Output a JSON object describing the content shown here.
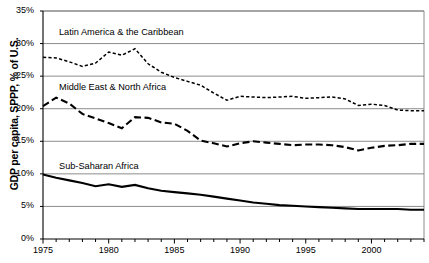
{
  "title_fragment": "",
  "axes": {
    "y_label": "GDP per capita, SPPP, % of U.S.",
    "y_ticks": [
      "35%",
      "30%",
      "25%",
      "20%",
      "15%",
      "10%",
      "5%",
      "0%"
    ],
    "x_ticks": [
      "1975",
      "1980",
      "1985",
      "1990",
      "1995",
      "2000"
    ]
  },
  "series_labels": {
    "lac": "Latin America & the Caribbean",
    "mena": "Middle East & North Africa",
    "ssa": "Sub-Saharan Africa"
  },
  "chart_data": {
    "type": "line",
    "title": "",
    "xlabel": "",
    "ylabel": "GDP per capita, SPPP, % of U.S.",
    "xlim": [
      1975,
      2004
    ],
    "ylim": [
      0,
      35
    ],
    "y_tick_values": [
      0,
      5,
      10,
      15,
      20,
      25,
      30,
      35
    ],
    "x_tick_values": [
      1975,
      1980,
      1985,
      1990,
      1995,
      2000
    ],
    "x_minor_tick_step": 1,
    "grid": "horizontal",
    "legend": "inline-labels",
    "y_unit": "percent",
    "x": [
      1975,
      1976,
      1977,
      1978,
      1979,
      1980,
      1981,
      1982,
      1983,
      1984,
      1985,
      1986,
      1987,
      1988,
      1989,
      1990,
      1991,
      1992,
      1993,
      1994,
      1995,
      1996,
      1997,
      1998,
      1999,
      2000,
      2001,
      2002,
      2003,
      2004
    ],
    "series": [
      {
        "name": "Latin America & the Caribbean",
        "style": "short-dash",
        "values": [
          27.9,
          27.8,
          27.2,
          26.5,
          27.0,
          28.7,
          28.2,
          29.2,
          26.9,
          25.6,
          24.8,
          24.2,
          23.6,
          22.4,
          21.3,
          21.9,
          21.8,
          21.7,
          21.8,
          21.9,
          21.6,
          21.7,
          21.8,
          21.5,
          20.5,
          20.7,
          20.5,
          19.8,
          19.7,
          19.7
        ]
      },
      {
        "name": "Middle East & North Africa",
        "style": "long-dash",
        "values": [
          20.4,
          21.7,
          20.8,
          19.2,
          18.5,
          17.8,
          17.0,
          18.7,
          18.6,
          17.9,
          17.7,
          16.6,
          15.1,
          14.7,
          14.2,
          14.7,
          15.0,
          14.8,
          14.6,
          14.4,
          14.5,
          14.5,
          14.4,
          14.1,
          13.6,
          14.0,
          14.3,
          14.4,
          14.6,
          14.6
        ]
      },
      {
        "name": "Sub-Saharan Africa",
        "style": "solid",
        "values": [
          9.9,
          9.4,
          9.0,
          8.6,
          8.1,
          8.4,
          8.0,
          8.3,
          7.8,
          7.4,
          7.2,
          7.0,
          6.8,
          6.5,
          6.2,
          5.9,
          5.6,
          5.4,
          5.2,
          5.1,
          5.0,
          4.9,
          4.8,
          4.7,
          4.6,
          4.6,
          4.6,
          4.6,
          4.5,
          4.5
        ]
      }
    ]
  },
  "colors": {
    "line": "#000000",
    "grid": "#808080",
    "axis": "#000000",
    "background": "#ffffff"
  }
}
